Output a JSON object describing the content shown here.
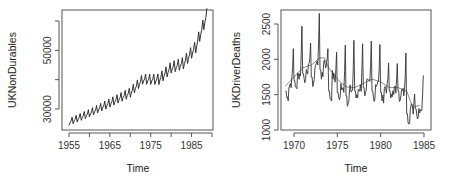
{
  "chart_data": [
    {
      "type": "line",
      "title": "",
      "xlabel": "Time",
      "ylabel": "UKNonDurables",
      "xlim": [
        1955,
        1989
      ],
      "ylim": [
        24000,
        64000
      ],
      "xticks": [
        1955,
        1960,
        1965,
        1970,
        1975,
        1980,
        1985,
        1990
      ],
      "xtick_labels": [
        "1955",
        "",
        "1965",
        "",
        "1975",
        "",
        "1985",
        ""
      ],
      "yticks": [
        30000,
        40000,
        50000,
        60000
      ],
      "ytick_labels": [
        "30000",
        "",
        "50000",
        ""
      ],
      "grid": false,
      "legend": null,
      "series": [
        {
          "name": "UKNonDurables",
          "frequency": "quarterly",
          "description": "Seasonal sawtooth with upward trend",
          "trend_points": [
            {
              "x": 1955,
              "y": 25500
            },
            {
              "x": 1960,
              "y": 28500
            },
            {
              "x": 1965,
              "y": 32000
            },
            {
              "x": 1970,
              "y": 35500
            },
            {
              "x": 1973,
              "y": 40000
            },
            {
              "x": 1977,
              "y": 40000
            },
            {
              "x": 1980,
              "y": 44000
            },
            {
              "x": 1983,
              "y": 45500
            },
            {
              "x": 1986,
              "y": 51000
            },
            {
              "x": 1988.75,
              "y": 62000
            }
          ],
          "seasonal_amplitude": 2800
        }
      ]
    },
    {
      "type": "line",
      "title": "",
      "xlabel": "Time",
      "ylabel": "UKDriverDeaths",
      "xlim": [
        1968.5,
        1985.5
      ],
      "ylim": [
        1000,
        2700
      ],
      "xticks": [
        1970,
        1975,
        1980,
        1985
      ],
      "xtick_labels": [
        "1970",
        "1975",
        "1980",
        "1985"
      ],
      "yticks": [
        1000,
        1500,
        2000,
        2500
      ],
      "ytick_labels": [
        "1000",
        "1500",
        "2000",
        "2500"
      ],
      "grid": false,
      "legend": null,
      "series": [
        {
          "name": "UKDriverDeaths",
          "frequency": "monthly",
          "color": "#333333",
          "annual_peaks": [
            {
              "x": 1969.9,
              "y": 2150
            },
            {
              "x": 1970.9,
              "y": 2470
            },
            {
              "x": 1971.9,
              "y": 2230
            },
            {
              "x": 1972.9,
              "y": 2650
            },
            {
              "x": 1973.9,
              "y": 2150
            },
            {
              "x": 1974.9,
              "y": 2100
            },
            {
              "x": 1975.9,
              "y": 2200
            },
            {
              "x": 1976.9,
              "y": 2270
            },
            {
              "x": 1977.9,
              "y": 2220
            },
            {
              "x": 1978.9,
              "y": 2260
            },
            {
              "x": 1979.9,
              "y": 2210
            },
            {
              "x": 1980.9,
              "y": 1950
            },
            {
              "x": 1981.9,
              "y": 1940
            },
            {
              "x": 1982.9,
              "y": 2090
            },
            {
              "x": 1983.9,
              "y": 1510
            },
            {
              "x": 1984.9,
              "y": 1770
            }
          ],
          "annual_troughs": [
            {
              "x": 1969.3,
              "y": 1400
            },
            {
              "x": 1970.3,
              "y": 1550
            },
            {
              "x": 1971.3,
              "y": 1650
            },
            {
              "x": 1972.3,
              "y": 1600
            },
            {
              "x": 1973.3,
              "y": 1700
            },
            {
              "x": 1974.3,
              "y": 1400
            },
            {
              "x": 1975.3,
              "y": 1380
            },
            {
              "x": 1976.3,
              "y": 1330
            },
            {
              "x": 1977.3,
              "y": 1400
            },
            {
              "x": 1978.3,
              "y": 1450
            },
            {
              "x": 1979.3,
              "y": 1400
            },
            {
              "x": 1980.3,
              "y": 1380
            },
            {
              "x": 1981.3,
              "y": 1400
            },
            {
              "x": 1982.3,
              "y": 1400
            },
            {
              "x": 1983.3,
              "y": 1080
            },
            {
              "x": 1984.3,
              "y": 1150
            }
          ]
        },
        {
          "name": "Smoothed trend",
          "color": "#888888",
          "points": [
            {
              "x": 1969,
              "y": 1620
            },
            {
              "x": 1970,
              "y": 1750
            },
            {
              "x": 1971,
              "y": 1880
            },
            {
              "x": 1972,
              "y": 1920
            },
            {
              "x": 1973,
              "y": 2020
            },
            {
              "x": 1973.5,
              "y": 2020
            },
            {
              "x": 1974,
              "y": 1880
            },
            {
              "x": 1975,
              "y": 1720
            },
            {
              "x": 1976,
              "y": 1610
            },
            {
              "x": 1977,
              "y": 1600
            },
            {
              "x": 1978,
              "y": 1660
            },
            {
              "x": 1979,
              "y": 1720
            },
            {
              "x": 1980,
              "y": 1680
            },
            {
              "x": 1981,
              "y": 1600
            },
            {
              "x": 1982,
              "y": 1600
            },
            {
              "x": 1983,
              "y": 1550
            },
            {
              "x": 1983.7,
              "y": 1320
            },
            {
              "x": 1984.5,
              "y": 1350
            }
          ]
        }
      ]
    }
  ],
  "plots": [
    {
      "xlabel": "Time",
      "ylabel": "UKNonDurables",
      "xtick_labels": [
        "1955",
        "1965",
        "1975",
        "1985"
      ],
      "ytick_labels": [
        "30000",
        "50000"
      ]
    },
    {
      "xlabel": "Time",
      "ylabel": "UKDriverDeaths",
      "xtick_labels": [
        "1970",
        "1975",
        "1980",
        "1985"
      ],
      "ytick_labels": [
        "1000",
        "1500",
        "2000",
        "2500"
      ]
    }
  ],
  "colors": {
    "frame": "#555555",
    "series_main": "#333333",
    "series_trend": "#8a8a8a",
    "text": "#333333"
  }
}
